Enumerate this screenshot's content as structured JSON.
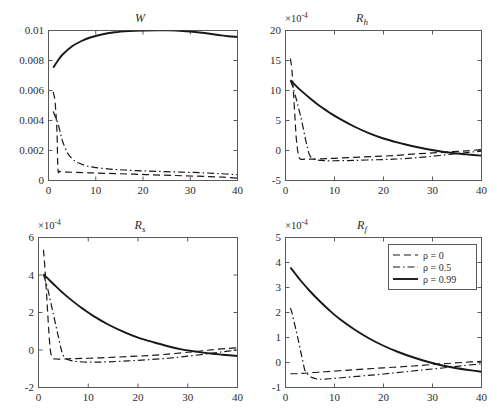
{
  "figure": {
    "panel_count": 4,
    "background": "#ffffff",
    "line_color": "#181818",
    "axis_color": "#5a5a5a"
  },
  "legend": {
    "position": "top-right of bottom-right panel",
    "entries": [
      {
        "label": "ρ = 0",
        "style": "dashed"
      },
      {
        "label": "ρ = 0.5",
        "style": "dashdot"
      },
      {
        "label": "ρ = 0.99",
        "style": "solid"
      }
    ]
  },
  "chart_data": [
    {
      "id": "panel-w",
      "type": "line",
      "title": "W",
      "title_sub": "",
      "xlabel": "",
      "ylabel": "",
      "xlim": [
        0,
        40
      ],
      "ylim": [
        0,
        0.01
      ],
      "xticks": [
        0,
        10,
        20,
        30,
        40
      ],
      "xticklabels": [
        "0",
        "10",
        "20",
        "30",
        "40"
      ],
      "yticks": [
        0,
        0.002,
        0.004,
        0.006,
        0.008,
        0.01
      ],
      "yticklabels": [
        "0",
        "0.002",
        "0.004",
        "0.006",
        "0.008",
        "0.01"
      ],
      "y_exponent": "",
      "grid": false,
      "series": [
        {
          "name": "ρ = 0",
          "style": "dashed",
          "x": [
            1,
            1.4,
            1.8,
            2,
            2.4,
            3,
            4,
            6,
            8,
            10,
            14,
            18,
            22,
            26,
            30,
            34,
            37,
            40
          ],
          "y": [
            0.0059,
            0.0052,
            0.0032,
            0.00075,
            0.00062,
            0.00058,
            0.00056,
            0.00054,
            0.00052,
            0.0005,
            0.00046,
            0.00042,
            0.00038,
            0.00034,
            0.0003,
            0.00026,
            0.00022,
            0.00016
          ]
        },
        {
          "name": "ρ = 0.5",
          "style": "dashdot",
          "x": [
            1,
            1.5,
            2,
            2.5,
            3,
            4,
            5,
            6,
            8,
            10,
            13,
            16,
            20,
            24,
            28,
            32,
            36,
            40
          ],
          "y": [
            0.0046,
            0.0042,
            0.0038,
            0.0032,
            0.0026,
            0.00185,
            0.00145,
            0.00122,
            0.00098,
            0.00086,
            0.00076,
            0.0007,
            0.00064,
            0.0006,
            0.00056,
            0.00052,
            0.00046,
            0.00038
          ]
        },
        {
          "name": "ρ = 0.99",
          "style": "solid",
          "x": [
            1,
            2,
            3,
            5,
            7,
            9,
            11,
            14,
            17,
            20,
            23,
            25,
            27,
            30,
            33,
            36,
            38,
            40
          ],
          "y": [
            0.00752,
            0.008,
            0.0084,
            0.00895,
            0.0093,
            0.00955,
            0.00972,
            0.00988,
            0.00996,
            0.01,
            0.010015,
            0.010015,
            0.01,
            0.00993,
            0.00983,
            0.0097,
            0.00962,
            0.00957
          ]
        }
      ]
    },
    {
      "id": "panel-rh",
      "type": "line",
      "title": "R",
      "title_sub": "h",
      "xlabel": "",
      "ylabel": "",
      "xlim": [
        0,
        40
      ],
      "ylim": [
        -5,
        20
      ],
      "xticks": [
        0,
        10,
        20,
        30,
        40
      ],
      "xticklabels": [
        "0",
        "10",
        "20",
        "30",
        "40"
      ],
      "yticks": [
        -5,
        0,
        5,
        10,
        15,
        20
      ],
      "yticklabels": [
        "-5",
        "0",
        "5",
        "10",
        "15",
        "20"
      ],
      "y_exponent": "×10",
      "y_exponent_sup": "-4",
      "grid": false,
      "series": [
        {
          "name": "ρ = 0",
          "style": "dashed",
          "x": [
            1,
            1.3,
            1.6,
            1.9,
            2.2,
            2.6,
            3,
            4,
            5,
            7,
            10,
            14,
            18,
            22,
            26,
            30,
            34,
            37,
            40
          ],
          "y": [
            15.3,
            13.5,
            10.0,
            6.0,
            2.0,
            -0.6,
            -1.4,
            -1.45,
            -1.45,
            -1.4,
            -1.3,
            -1.15,
            -1.0,
            -0.85,
            -0.6,
            -0.4,
            -0.2,
            -0.05,
            0.15
          ]
        },
        {
          "name": "ρ = 0.5",
          "style": "dashdot",
          "x": [
            1,
            1.5,
            2,
            2.5,
            3,
            3.5,
            4,
            4.5,
            5,
            6,
            8,
            11,
            14,
            18,
            22,
            26,
            30,
            34,
            37,
            40
          ],
          "y": [
            11.6,
            10.6,
            9.2,
            7.6,
            6.0,
            4.2,
            2.2,
            0.4,
            -0.9,
            -1.5,
            -1.7,
            -1.7,
            -1.65,
            -1.55,
            -1.45,
            -1.25,
            -0.95,
            -0.6,
            -0.35,
            -0.1
          ]
        },
        {
          "name": "ρ = 0.99",
          "style": "solid",
          "x": [
            1,
            2,
            3,
            5,
            7,
            9,
            11,
            14,
            17,
            20,
            23,
            26,
            29,
            32,
            35,
            37,
            40
          ],
          "y": [
            11.7,
            10.9,
            10.1,
            8.7,
            7.4,
            6.3,
            5.3,
            4.0,
            2.9,
            2.0,
            1.3,
            0.7,
            0.2,
            -0.2,
            -0.5,
            -0.65,
            -0.85
          ]
        }
      ]
    },
    {
      "id": "panel-rs",
      "type": "line",
      "title": "R",
      "title_sub": "s",
      "xlabel": "",
      "ylabel": "",
      "xlim": [
        0,
        40
      ],
      "ylim": [
        -2,
        6
      ],
      "xticks": [
        0,
        10,
        20,
        30,
        40
      ],
      "xticklabels": [
        "0",
        "10",
        "20",
        "30",
        "40"
      ],
      "yticks": [
        -2,
        0,
        2,
        4,
        6
      ],
      "yticklabels": [
        "-2",
        "0",
        "2",
        "4",
        "6"
      ],
      "y_exponent": "×10",
      "y_exponent_sup": "-4",
      "grid": false,
      "series": [
        {
          "name": "ρ = 0",
          "style": "dashed",
          "x": [
            1,
            1.2,
            1.5,
            1.8,
            2.1,
            2.4,
            2.8,
            3.5,
            5,
            7,
            10,
            14,
            18,
            22,
            26,
            30,
            33,
            36,
            40
          ],
          "y": [
            5.35,
            4.7,
            3.5,
            2.2,
            0.9,
            -0.05,
            -0.42,
            -0.48,
            -0.48,
            -0.46,
            -0.44,
            -0.4,
            -0.35,
            -0.3,
            -0.22,
            -0.12,
            -0.04,
            0.04,
            0.12
          ]
        },
        {
          "name": "ρ = 0.5",
          "style": "dashdot",
          "x": [
            1,
            1.5,
            2,
            2.5,
            3,
            3.5,
            4,
            4.5,
            5,
            6,
            8,
            11,
            14,
            18,
            22,
            26,
            30,
            34,
            37,
            40
          ],
          "y": [
            4.0,
            3.6,
            3.1,
            2.5,
            1.9,
            1.3,
            0.7,
            0.1,
            -0.3,
            -0.52,
            -0.62,
            -0.65,
            -0.63,
            -0.58,
            -0.52,
            -0.44,
            -0.33,
            -0.2,
            -0.1,
            0.0
          ]
        },
        {
          "name": "ρ = 0.99",
          "style": "solid",
          "x": [
            1,
            2,
            3,
            5,
            7,
            9,
            11,
            14,
            17,
            20,
            23,
            26,
            29,
            32,
            35,
            37,
            40
          ],
          "y": [
            4.05,
            3.78,
            3.52,
            3.02,
            2.58,
            2.18,
            1.82,
            1.36,
            0.98,
            0.66,
            0.42,
            0.2,
            0.02,
            -0.1,
            -0.2,
            -0.25,
            -0.32
          ]
        }
      ]
    },
    {
      "id": "panel-rf",
      "type": "line",
      "title": "R",
      "title_sub": "f",
      "xlabel": "",
      "ylabel": "",
      "xlim": [
        0,
        40
      ],
      "ylim": [
        -1,
        5
      ],
      "xticks": [
        0,
        10,
        20,
        30,
        40
      ],
      "xticklabels": [
        "0",
        "10",
        "20",
        "30",
        "40"
      ],
      "yticks": [
        -1,
        0,
        1,
        2,
        3,
        4,
        5
      ],
      "yticklabels": [
        "-1",
        "0",
        "1",
        "2",
        "3",
        "4",
        "5"
      ],
      "y_exponent": "×10",
      "y_exponent_sup": "-4",
      "grid": false,
      "series": [
        {
          "name": "ρ = 0",
          "style": "dashed",
          "x": [
            1,
            2,
            3,
            4,
            6,
            8,
            11,
            14,
            18,
            22,
            26,
            30,
            33,
            36,
            40
          ],
          "y": [
            -0.45,
            -0.45,
            -0.44,
            -0.43,
            -0.4,
            -0.37,
            -0.33,
            -0.29,
            -0.24,
            -0.19,
            -0.14,
            -0.08,
            -0.04,
            0.0,
            0.05
          ]
        },
        {
          "name": "ρ = 0.5",
          "style": "dashdot",
          "x": [
            1,
            1.3,
            1.6,
            2,
            2.4,
            2.8,
            3.2,
            3.6,
            4,
            5,
            6,
            7,
            9,
            12,
            16,
            20,
            24,
            28,
            32,
            36,
            40
          ],
          "y": [
            2.18,
            2.0,
            1.75,
            1.42,
            1.08,
            0.72,
            0.35,
            0.0,
            -0.33,
            -0.55,
            -0.64,
            -0.67,
            -0.65,
            -0.6,
            -0.53,
            -0.46,
            -0.38,
            -0.3,
            -0.22,
            -0.13,
            -0.05
          ]
        },
        {
          "name": "ρ = 0.99",
          "style": "solid",
          "x": [
            1,
            2,
            3,
            5,
            7,
            9,
            11,
            14,
            17,
            20,
            23,
            26,
            29,
            32,
            35,
            37,
            40
          ],
          "y": [
            3.8,
            3.55,
            3.3,
            2.85,
            2.45,
            2.08,
            1.75,
            1.33,
            0.97,
            0.67,
            0.42,
            0.21,
            0.03,
            -0.12,
            -0.23,
            -0.29,
            -0.37
          ]
        }
      ]
    }
  ]
}
